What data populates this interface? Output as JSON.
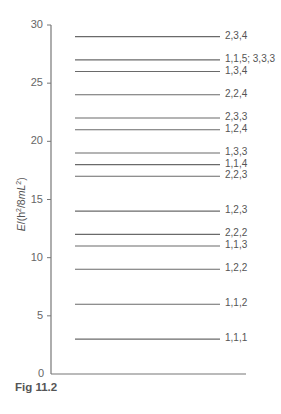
{
  "chart_data": {
    "type": "energy-level-diagram",
    "title": "",
    "caption": "Fig 11.2",
    "ylabel": "E/(h²/8mL²)",
    "xlabel": "",
    "ylim": [
      0,
      30
    ],
    "yticks": [
      0,
      5,
      10,
      15,
      20,
      25,
      30
    ],
    "grid": false,
    "levels": [
      {
        "energy": 3,
        "label": "1,1,1"
      },
      {
        "energy": 6,
        "label": "1,1,2"
      },
      {
        "energy": 9,
        "label": "1,2,2"
      },
      {
        "energy": 11,
        "label": "1,1,3"
      },
      {
        "energy": 12,
        "label": "2,2,2"
      },
      {
        "energy": 14,
        "label": "1,2,3"
      },
      {
        "energy": 17,
        "label": "2,2,3"
      },
      {
        "energy": 18,
        "label": "1,1,4"
      },
      {
        "energy": 19,
        "label": "1,3,3"
      },
      {
        "energy": 21,
        "label": "1,2,4"
      },
      {
        "energy": 22,
        "label": "2,3,3"
      },
      {
        "energy": 24,
        "label": "2,2,4"
      },
      {
        "energy": 26,
        "label": "1,3,4"
      },
      {
        "energy": 27,
        "label": "1,1,5; 3,3,3"
      },
      {
        "energy": 29,
        "label": "2,3,4"
      }
    ]
  },
  "axis": {
    "ytick_labels": [
      "0",
      "5",
      "10",
      "15",
      "20",
      "25",
      "30"
    ]
  },
  "caption": "Fig 11.2",
  "ylabel_text": "E/(h²/8mL²)"
}
